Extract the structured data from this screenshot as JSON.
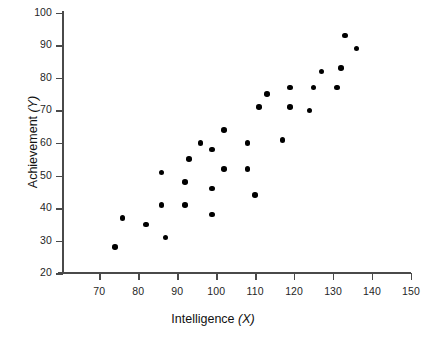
{
  "chart_data": {
    "type": "scatter",
    "title": "",
    "xlabel": "Intelligence (X)",
    "ylabel": "Achievement (Y)",
    "xlim": [
      60,
      150
    ],
    "ylim": [
      20,
      100
    ],
    "xticks": [
      70,
      80,
      90,
      100,
      110,
      120,
      130,
      140,
      150
    ],
    "yticks": [
      20,
      30,
      40,
      50,
      60,
      70,
      80,
      90,
      100
    ],
    "grid": false,
    "legend": null,
    "marker": {
      "shape": "circle",
      "color": "#000000",
      "size": 5.6
    },
    "points": [
      {
        "x": 74,
        "y": 28
      },
      {
        "x": 76,
        "y": 37
      },
      {
        "x": 82,
        "y": 35
      },
      {
        "x": 86,
        "y": 51
      },
      {
        "x": 86,
        "y": 41
      },
      {
        "x": 87,
        "y": 31
      },
      {
        "x": 92,
        "y": 48
      },
      {
        "x": 92,
        "y": 41
      },
      {
        "x": 93,
        "y": 55
      },
      {
        "x": 96,
        "y": 60
      },
      {
        "x": 99,
        "y": 58
      },
      {
        "x": 99,
        "y": 46
      },
      {
        "x": 99,
        "y": 38
      },
      {
        "x": 102,
        "y": 64
      },
      {
        "x": 102,
        "y": 52
      },
      {
        "x": 108,
        "y": 60
      },
      {
        "x": 108,
        "y": 52
      },
      {
        "x": 110,
        "y": 44
      },
      {
        "x": 111,
        "y": 71
      },
      {
        "x": 113,
        "y": 75
      },
      {
        "x": 117,
        "y": 61
      },
      {
        "x": 119,
        "y": 77
      },
      {
        "x": 119,
        "y": 71
      },
      {
        "x": 124,
        "y": 70
      },
      {
        "x": 125,
        "y": 77
      },
      {
        "x": 127,
        "y": 82
      },
      {
        "x": 131,
        "y": 77
      },
      {
        "x": 132,
        "y": 83
      },
      {
        "x": 133,
        "y": 93
      },
      {
        "x": 136,
        "y": 89
      }
    ]
  },
  "axes": {
    "x_label_text": "Intelligence ",
    "x_label_var": "(X)",
    "y_label_text": "Achievement ",
    "y_label_var": "(Y)",
    "x_tick_labels": [
      "70",
      "80",
      "90",
      "100",
      "110",
      "120",
      "130",
      "140",
      "150"
    ],
    "y_tick_labels": [
      "20",
      "30",
      "40",
      "50",
      "60",
      "70",
      "80",
      "90",
      "100"
    ],
    "axis_color": "#4a4a4a"
  }
}
